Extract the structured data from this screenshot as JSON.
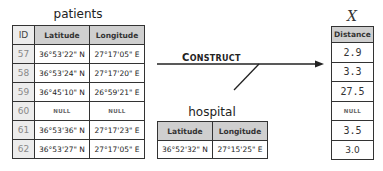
{
  "patients": {
    "title": "patients",
    "columns": [
      "ID",
      "Latitude",
      "Longitude"
    ],
    "rows": [
      {
        "id": "57",
        "lat": "36°53'22\" N",
        "lon": "27°17'05\" E"
      },
      {
        "id": "58",
        "lat": "36°53'24\" N",
        "lon": "27°17'20\" E"
      },
      {
        "id": "59",
        "lat": "36°45'10\" N",
        "lon": "26°59'21\" E"
      },
      {
        "id": "60",
        "lat": "NULL",
        "lon": "NULL"
      },
      {
        "id": "61",
        "lat": "36°53'36\" N",
        "lon": "27°17'23\" E"
      },
      {
        "id": "62",
        "lat": "36°53'27\" N",
        "lon": "27°17'05\" E"
      }
    ]
  },
  "hospital": {
    "title": "hospital",
    "columns": [
      "Latitude",
      "Longitude"
    ],
    "rows": [
      {
        "lat": "36°52'32\" N",
        "lon": "27°15'25\" E"
      }
    ]
  },
  "operation": {
    "label_first": "C",
    "label_rest": "ONSTRUCT"
  },
  "result": {
    "title": "X",
    "column": "Distance",
    "values": [
      "2.9",
      "3.3",
      "27.5",
      "NULL",
      "3.5",
      "3.0"
    ]
  }
}
